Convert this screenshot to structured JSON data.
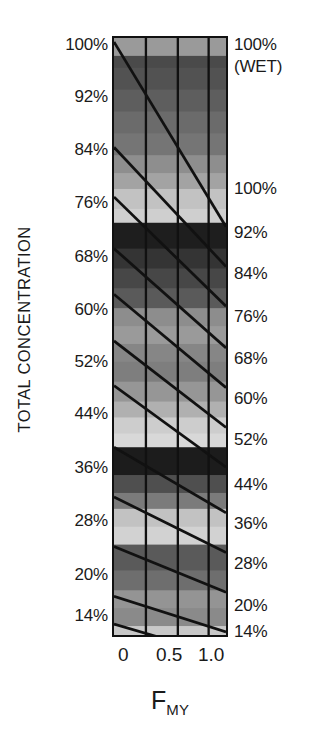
{
  "figure": {
    "background_color": "#ffffff",
    "frame_color": "#111111",
    "line_color": "#1a1a1a"
  },
  "axes": {
    "y_title": "TOTAL CONCENTRATION",
    "x_title_main": "F",
    "x_title_sub": "MY"
  },
  "x_ticks": [
    {
      "label": "0",
      "value": 0.0,
      "x_px": 118
    },
    {
      "label": "0.5",
      "value": 0.5,
      "x_px": 156
    },
    {
      "label": "1.0",
      "value": 1.0,
      "x_px": 198
    }
  ],
  "left_labels": [
    {
      "label": "100%",
      "y_px": 36
    },
    {
      "label": "92%",
      "y_px": 88
    },
    {
      "label": "84%",
      "y_px": 141
    },
    {
      "label": "76%",
      "y_px": 194
    },
    {
      "label": "68%",
      "y_px": 248
    },
    {
      "label": "60%",
      "y_px": 301
    },
    {
      "label": "52%",
      "y_px": 353
    },
    {
      "label": "44%",
      "y_px": 405
    },
    {
      "label": "36%",
      "y_px": 459
    },
    {
      "label": "28%",
      "y_px": 512
    },
    {
      "label": "20%",
      "y_px": 566
    },
    {
      "label": "14%",
      "y_px": 607
    }
  ],
  "right_labels": [
    {
      "label": "100%",
      "y_px": 36
    },
    {
      "label": "(WET)",
      "y_px": 58
    },
    {
      "label": "100%",
      "y_px": 180
    },
    {
      "label": "92%",
      "y_px": 224
    },
    {
      "label": "84%",
      "y_px": 265
    },
    {
      "label": "76%",
      "y_px": 308
    },
    {
      "label": "68%",
      "y_px": 350
    },
    {
      "label": "60%",
      "y_px": 390
    },
    {
      "label": "52%",
      "y_px": 431
    },
    {
      "label": "44%",
      "y_px": 476
    },
    {
      "label": "36%",
      "y_px": 515
    },
    {
      "label": "28%",
      "y_px": 555
    },
    {
      "label": "20%",
      "y_px": 597
    },
    {
      "label": "14%",
      "y_px": 623
    }
  ],
  "chart_data": {
    "type": "heatmap",
    "title": "",
    "xlabel": "F_MY",
    "ylabel": "TOTAL CONCENTRATION",
    "xlim": [
      0.0,
      1.0
    ],
    "ylim": [
      14,
      100
    ],
    "grid": true,
    "legend": "none",
    "x_tick_values": [
      0.0,
      0.5,
      1.0
    ],
    "y_tick_values_left": [
      100,
      92,
      84,
      76,
      68,
      60,
      52,
      44,
      36,
      28,
      20,
      14
    ],
    "y_tick_values_right": [
      100,
      92,
      84,
      76,
      68,
      60,
      52,
      44,
      36,
      28,
      20,
      14
    ],
    "vertical_gridlines_x": [
      0.0,
      0.285,
      0.57,
      0.845,
      1.0
    ],
    "bands": [
      {
        "y0": 0,
        "y1": 18,
        "gray": "#9a9a9a"
      },
      {
        "y0": 18,
        "y1": 30,
        "gray": "#4a4a4a"
      },
      {
        "y0": 30,
        "y1": 52,
        "gray": "#525252"
      },
      {
        "y0": 52,
        "y1": 74,
        "gray": "#5e5e5e"
      },
      {
        "y0": 74,
        "y1": 96,
        "gray": "#6b6b6b"
      },
      {
        "y0": 96,
        "y1": 118,
        "gray": "#757575"
      },
      {
        "y0": 118,
        "y1": 136,
        "gray": "#8e8e8e"
      },
      {
        "y0": 136,
        "y1": 152,
        "gray": "#a3a3a3"
      },
      {
        "y0": 152,
        "y1": 172,
        "gray": "#c2c2c2"
      },
      {
        "y0": 172,
        "y1": 186,
        "gray": "#cfcfcf"
      },
      {
        "y0": 186,
        "y1": 212,
        "gray": "#1e1e1e"
      },
      {
        "y0": 212,
        "y1": 232,
        "gray": "#343434"
      },
      {
        "y0": 232,
        "y1": 252,
        "gray": "#474747"
      },
      {
        "y0": 252,
        "y1": 272,
        "gray": "#5a5a5a"
      },
      {
        "y0": 272,
        "y1": 290,
        "gray": "#8d8d8d"
      },
      {
        "y0": 290,
        "y1": 308,
        "gray": "#9a9a9a"
      },
      {
        "y0": 308,
        "y1": 326,
        "gray": "#868686"
      },
      {
        "y0": 326,
        "y1": 346,
        "gray": "#7e7e7e"
      },
      {
        "y0": 346,
        "y1": 366,
        "gray": "#969696"
      },
      {
        "y0": 366,
        "y1": 382,
        "gray": "#b0b0b0"
      },
      {
        "y0": 382,
        "y1": 398,
        "gray": "#cdcdcd"
      },
      {
        "y0": 398,
        "y1": 412,
        "gray": "#d8d8d8"
      },
      {
        "y0": 412,
        "y1": 440,
        "gray": "#1c1c1c"
      },
      {
        "y0": 440,
        "y1": 458,
        "gray": "#4f4f4f"
      },
      {
        "y0": 458,
        "y1": 474,
        "gray": "#7b7b7b"
      },
      {
        "y0": 474,
        "y1": 492,
        "gray": "#c2c2c2"
      },
      {
        "y0": 492,
        "y1": 510,
        "gray": "#d2d2d2"
      },
      {
        "y0": 510,
        "y1": 536,
        "gray": "#5a5a5a"
      },
      {
        "y0": 536,
        "y1": 556,
        "gray": "#6e6e6e"
      },
      {
        "y0": 556,
        "y1": 574,
        "gray": "#949494"
      },
      {
        "y0": 574,
        "y1": 592,
        "gray": "#8a8a8a"
      },
      {
        "y0": 592,
        "y1": 601,
        "gray": "#c8c8c8"
      }
    ],
    "contour_lines": [
      {
        "x0": 0,
        "y0": 4,
        "x1": 116,
        "y1": 190
      },
      {
        "x0": 0,
        "y0": 110,
        "x1": 116,
        "y1": 230
      },
      {
        "x0": 0,
        "y0": 160,
        "x1": 116,
        "y1": 270
      },
      {
        "x0": 0,
        "y0": 212,
        "x1": 116,
        "y1": 312
      },
      {
        "x0": 0,
        "y0": 258,
        "x1": 116,
        "y1": 352
      },
      {
        "x0": 0,
        "y0": 305,
        "x1": 116,
        "y1": 392
      },
      {
        "x0": 0,
        "y0": 350,
        "x1": 116,
        "y1": 432
      },
      {
        "x0": 0,
        "y0": 412,
        "x1": 116,
        "y1": 478
      },
      {
        "x0": 0,
        "y0": 462,
        "x1": 116,
        "y1": 518
      },
      {
        "x0": 0,
        "y0": 512,
        "x1": 116,
        "y1": 558
      },
      {
        "x0": 0,
        "y0": 562,
        "x1": 116,
        "y1": 598
      },
      {
        "x0": 0,
        "y0": 590,
        "x1": 116,
        "y1": 623
      }
    ]
  }
}
